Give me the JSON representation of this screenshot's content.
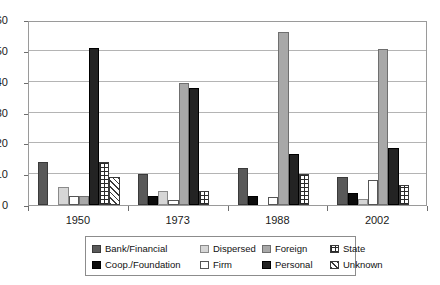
{
  "chart_data": {
    "type": "bar",
    "title": "",
    "subtitle": "",
    "xlabel": "",
    "ylabel": "",
    "categories": [
      "1950",
      "1973",
      "1988",
      "2002"
    ],
    "ylim": [
      0,
      60
    ],
    "ytick_values": [
      0,
      10,
      20,
      30,
      40,
      50,
      60
    ],
    "ytick_labels": [
      "0",
      "10",
      "20",
      "30",
      "40",
      "50",
      "60"
    ],
    "grid": true,
    "legend_position": "bottom",
    "series": [
      {
        "name": "Bank/Financial",
        "color": "#595959",
        "pattern": "solid",
        "values": [
          14,
          10,
          12,
          9
        ]
      },
      {
        "name": "Coop./Foundation",
        "color": "#0c0c0c",
        "pattern": "solid",
        "values": [
          0,
          3,
          3,
          4
        ]
      },
      {
        "name": "Dispersed",
        "color": "#d6d6d6",
        "pattern": "solid",
        "values": [
          6,
          4.5,
          0,
          2
        ]
      },
      {
        "name": "Firm",
        "color": "#ffffff",
        "pattern": "solid",
        "values": [
          3,
          1.5,
          2.5,
          8
        ]
      },
      {
        "name": "Foreign",
        "color": "#a8a8a8",
        "pattern": "solid",
        "values": [
          3,
          39.5,
          56,
          50.5
        ]
      },
      {
        "name": "Personal",
        "color": "#232323",
        "pattern": "solid",
        "values": [
          51,
          38,
          16.5,
          18.5
        ]
      },
      {
        "name": "State",
        "color": "#ffffff",
        "pattern": "dotted-grid",
        "values": [
          14,
          4.5,
          10,
          6.5
        ]
      },
      {
        "name": "Unknown",
        "color": "#ffffff",
        "pattern": "hatch-45",
        "values": [
          9,
          0,
          0,
          0
        ]
      }
    ]
  },
  "legend": {
    "entries": [
      {
        "label": "Bank/Financial",
        "swatch": "sw-bank"
      },
      {
        "label": "Dispersed",
        "swatch": "sw-dispersed"
      },
      {
        "label": "Foreign",
        "swatch": "sw-foreign"
      },
      {
        "label": "State",
        "swatch": "sw-state"
      },
      {
        "label": "Coop./Foundation",
        "swatch": "sw-coop"
      },
      {
        "label": "Firm",
        "swatch": "sw-firm"
      },
      {
        "label": "Personal",
        "swatch": "sw-personal"
      },
      {
        "label": "Unknown",
        "swatch": "sw-unknown"
      }
    ]
  },
  "colors": {
    "grid": "#b4b4b4",
    "axis": "#6d6d6d",
    "frame": "#9a9a9a",
    "text": "#1a1a1a",
    "background": "#ffffff"
  }
}
